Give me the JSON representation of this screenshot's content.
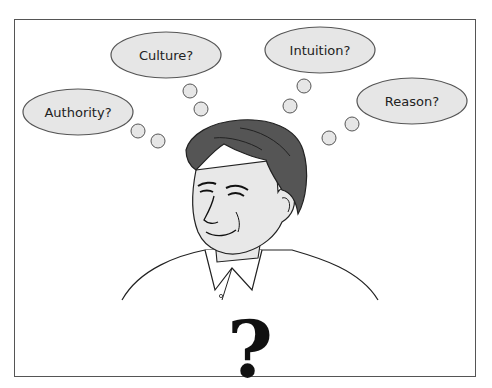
{
  "illustration": {
    "subject": "man-thinking",
    "thought_bubbles": [
      {
        "label": "Authority?",
        "cx": 78,
        "cy": 112
      },
      {
        "label": "Culture?",
        "cx": 166,
        "cy": 55
      },
      {
        "label": "Intuition?",
        "cx": 320,
        "cy": 50
      },
      {
        "label": "Reason?",
        "cx": 412,
        "cy": 101
      }
    ],
    "question_mark": "?",
    "colors": {
      "bubble_fill": "#e6e6e6",
      "bubble_stroke": "#555555",
      "hair": "#555555",
      "skin": "#e8e8e8",
      "frame": "#555555"
    }
  }
}
